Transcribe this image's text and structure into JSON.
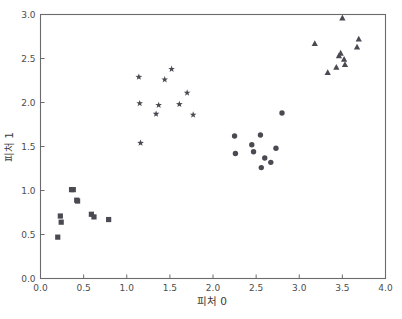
{
  "chart_data": {
    "type": "scatter",
    "title": "",
    "xlabel": "피처 0",
    "ylabel": "피처 1",
    "xlim": [
      0.0,
      4.0
    ],
    "ylim": [
      0.0,
      3.0
    ],
    "xticks": [
      "0.0",
      "0.5",
      "1.0",
      "1.5",
      "2.0",
      "2.5",
      "3.0",
      "3.5",
      "4.0"
    ],
    "xtick_values": [
      0.0,
      0.5,
      1.0,
      1.5,
      2.0,
      2.5,
      3.0,
      3.5,
      4.0
    ],
    "yticks": [
      "0.0",
      "0.5",
      "1.0",
      "1.5",
      "2.0",
      "2.5",
      "3.0"
    ],
    "ytick_values": [
      0.0,
      0.5,
      1.0,
      1.5,
      2.0,
      2.5,
      3.0
    ],
    "grid": false,
    "legend": false,
    "legend_position": "none",
    "marker_color": "#4a4a52",
    "axis_color": "#6b6b6b",
    "background": "#ffffff",
    "series": [
      {
        "name": "cluster-0",
        "marker": "square",
        "color": "#4a4a52",
        "points": [
          [
            0.2,
            0.47
          ],
          [
            0.23,
            0.71
          ],
          [
            0.24,
            0.64
          ],
          [
            0.36,
            1.01
          ],
          [
            0.38,
            1.01
          ],
          [
            0.42,
            0.89
          ],
          [
            0.43,
            0.88
          ],
          [
            0.59,
            0.73
          ],
          [
            0.62,
            0.7
          ],
          [
            0.79,
            0.67
          ]
        ]
      },
      {
        "name": "cluster-1",
        "marker": "star",
        "color": "#4a4a52",
        "points": [
          [
            1.14,
            2.29
          ],
          [
            1.15,
            1.99
          ],
          [
            1.16,
            1.54
          ],
          [
            1.34,
            1.87
          ],
          [
            1.37,
            1.97
          ],
          [
            1.44,
            2.26
          ],
          [
            1.52,
            2.38
          ],
          [
            1.61,
            1.98
          ],
          [
            1.7,
            2.11
          ],
          [
            1.77,
            1.86
          ]
        ]
      },
      {
        "name": "cluster-2",
        "marker": "circle",
        "color": "#4a4a52",
        "points": [
          [
            2.25,
            1.62
          ],
          [
            2.26,
            1.42
          ],
          [
            2.45,
            1.52
          ],
          [
            2.47,
            1.44
          ],
          [
            2.55,
            1.63
          ],
          [
            2.56,
            1.26
          ],
          [
            2.6,
            1.37
          ],
          [
            2.67,
            1.32
          ],
          [
            2.73,
            1.48
          ],
          [
            2.8,
            1.88
          ]
        ]
      },
      {
        "name": "cluster-3",
        "marker": "triangle",
        "color": "#4a4a52",
        "points": [
          [
            3.18,
            2.67
          ],
          [
            3.33,
            2.34
          ],
          [
            3.43,
            2.4
          ],
          [
            3.46,
            2.53
          ],
          [
            3.48,
            2.56
          ],
          [
            3.5,
            2.96
          ],
          [
            3.52,
            2.49
          ],
          [
            3.53,
            2.43
          ],
          [
            3.67,
            2.63
          ],
          [
            3.69,
            2.72
          ]
        ]
      }
    ]
  }
}
